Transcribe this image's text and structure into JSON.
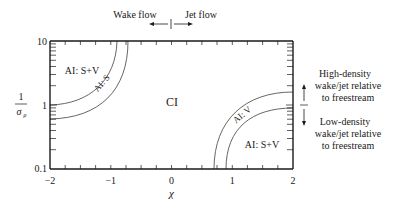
{
  "figure": {
    "type": "regime-diagram",
    "x_axis": {
      "label": "χ",
      "ticks": [
        "−2",
        "−1",
        "0",
        "1",
        "2"
      ],
      "range": [
        -2,
        2
      ]
    },
    "y_axis": {
      "label_numerator": "1",
      "label_denominator": "σ",
      "label_denominator_sub": "ρ",
      "ticks": [
        "10",
        "1",
        "0.1"
      ],
      "scale": "log",
      "range": [
        0.1,
        10
      ]
    },
    "regions": {
      "top_left_outer": "AI: S+V",
      "top_left_band": "AI: S",
      "center": "CI",
      "bottom_right_band": "AI: V",
      "bottom_right_outer": "AI: S+V"
    },
    "top_annotation": {
      "left": "Wake flow",
      "right": "Jet flow"
    },
    "right_annotation": {
      "upper": [
        "High-density",
        "wake/jet relative",
        "to freestream"
      ],
      "lower": [
        "Low-density",
        "wake/jet relative",
        "to freestream"
      ]
    },
    "colors": {
      "axis": "#1a1a1a",
      "curve": "#555555",
      "text": "#1a1a1a"
    }
  }
}
